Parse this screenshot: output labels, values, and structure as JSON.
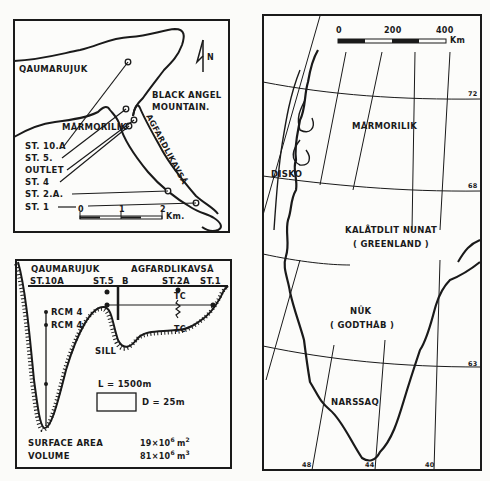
{
  "local_map": {
    "place_labels": {
      "qaumarujuk": "QAUMARUJUK",
      "black_angel_1": "BLACK ANGEL",
      "black_angel_2": "MOUNTAIN.",
      "marmorilik": "MÅRMORILIK",
      "agfardlikavsa": "AGFARDLIKAVSÅ"
    },
    "north_label": "N",
    "stations": [
      "ST. 10.A",
      "ST. 5.",
      "OUTLET",
      "ST. 4",
      "ST. 2.A.",
      "ST. 1"
    ],
    "scale": {
      "ticks": [
        "0",
        "1",
        "2"
      ],
      "unit": "Km."
    }
  },
  "profile": {
    "header_left": "QAUMARUJUK",
    "header_right": "AGFARDLIKAVSÅ",
    "stations": [
      "ST.10A",
      "ST.5",
      "B",
      "ST.2A",
      "ST.1"
    ],
    "instruments": {
      "rcm_1": "RCM 4",
      "rcm_2": "RCM 4",
      "tc_top": "TC",
      "tc_bottom": "TC"
    },
    "sill_label": "SILL",
    "scale": {
      "length": "L = 1500m",
      "depth": "D = 25m"
    },
    "stats": [
      {
        "label": "SURFACE AREA",
        "value": "19×10",
        "exp": "6",
        "unit": "m",
        "unit_exp": "2"
      },
      {
        "label": "VOLUME",
        "value": "81×10",
        "exp": "6",
        "unit": "m",
        "unit_exp": "3"
      }
    ]
  },
  "greenland_map": {
    "scale": {
      "ticks": [
        "0",
        "200",
        "400"
      ],
      "unit": "Km"
    },
    "place_labels": {
      "marmorilik": "MÅRMORILIK",
      "disko": "DISKO",
      "kalaallit": "KALÂTDLIT NUNAT",
      "greenland": "( GREENLAND )",
      "nuk": "NÛK",
      "godthab": "( GODTHÅB )",
      "narssaq": "NARSSAQ"
    },
    "latitudes": [
      "72",
      "68",
      "63"
    ],
    "longitudes": [
      "48",
      "44",
      "40"
    ]
  }
}
